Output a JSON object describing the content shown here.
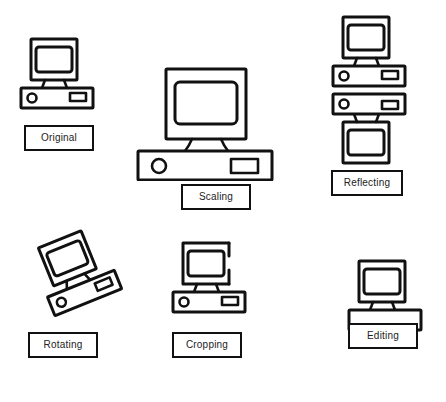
{
  "diagram": {
    "background_color": "#ffffff",
    "stroke_color": "#111111",
    "label_text_color": "#222222",
    "canvas": {
      "width": 446,
      "height": 402
    },
    "items": [
      {
        "id": "original",
        "label": "Original",
        "icon_name": "desktop-computer-icon",
        "transform": "none",
        "description": "Upright desktop computer with monitor and base unit",
        "label_box": {
          "x": 24,
          "y": 125,
          "width": 70,
          "height": 26
        },
        "figure": {
          "x": 18,
          "y": 36,
          "width": 80,
          "height": 78
        }
      },
      {
        "id": "scaling",
        "label": "Scaling",
        "icon_name": "desktop-computer-icon",
        "transform": "scale",
        "description": "Desktop computer enlarged approximately 1.8 times",
        "label_box": {
          "x": 181,
          "y": 184,
          "width": 70,
          "height": 26
        },
        "figure": {
          "x": 135,
          "y": 66,
          "width": 150,
          "height": 113
        }
      },
      {
        "id": "reflecting",
        "label": "Reflecting",
        "icon_name": "desktop-computer-icon",
        "transform": "mirror-vertical",
        "description": "Computer shown upright above its vertically mirrored copy",
        "label_box": {
          "x": 331,
          "y": 170,
          "width": 72,
          "height": 26
        },
        "figure": {
          "x": 330,
          "y": 14,
          "width": 80,
          "height": 152
        }
      },
      {
        "id": "rotating",
        "label": "Rotating",
        "icon_name": "desktop-computer-icon",
        "transform": "rotate",
        "rotation_degrees": -22,
        "description": "Desktop computer rotated counter-clockwise about 22 degrees",
        "label_box": {
          "x": 28,
          "y": 332,
          "width": 70,
          "height": 26
        },
        "figure": {
          "x": 22,
          "y": 228,
          "width": 110,
          "height": 98
        }
      },
      {
        "id": "cropping",
        "label": "Cropping",
        "icon_name": "desktop-computer-icon",
        "transform": "crop",
        "description": "Desktop computer with the monitor's right and lower-right edges cut away",
        "label_box": {
          "x": 172,
          "y": 332,
          "width": 70,
          "height": 26
        },
        "figure": {
          "x": 170,
          "y": 240,
          "width": 78,
          "height": 76
        }
      },
      {
        "id": "editing",
        "label": "Editing",
        "icon_name": "desktop-computer-icon",
        "transform": "edit",
        "description": "Desktop computer whose base unit details have been erased, leaving a blank box",
        "label_box": {
          "x": 348,
          "y": 323,
          "width": 70,
          "height": 26
        },
        "figure": {
          "x": 346,
          "y": 258,
          "width": 80,
          "height": 60
        }
      }
    ]
  }
}
